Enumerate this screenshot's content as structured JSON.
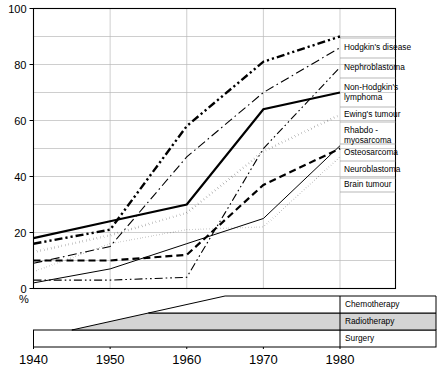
{
  "chart_data": {
    "type": "line",
    "title": "",
    "xlabel": "",
    "ylabel": "%",
    "ylim": [
      0,
      100
    ],
    "xlim": [
      1940,
      1980
    ],
    "yticks": [
      0,
      20,
      40,
      60,
      80,
      100
    ],
    "ytick_labels": [
      "0",
      "20",
      "40",
      "60",
      "80",
      "100"
    ],
    "xticks": [
      1940,
      1950,
      1960,
      1970,
      1980
    ],
    "xtick_labels": [
      "1940",
      "1950",
      "1960",
      "1970",
      "1980"
    ],
    "grid": "horizontal gridlines every 10 units, vertical gridlines at each decade",
    "legend_position": "right, line-ends labelled",
    "x": [
      1940,
      1950,
      1960,
      1970,
      1980
    ],
    "series": [
      {
        "name": "Hodgkin's disease",
        "style": "thick-dash-dot-dot",
        "x": [
          1940,
          1950,
          1960,
          1970,
          1980
        ],
        "values": [
          16,
          21,
          58,
          81,
          90
        ]
      },
      {
        "name": "Nephroblastoma",
        "style": "thin-dash-dot",
        "x": [
          1940,
          1950,
          1960,
          1970,
          1980
        ],
        "values": [
          9,
          15,
          47,
          70,
          86
        ]
      },
      {
        "name": "Non-Hodgkin's lymphoma",
        "style": "thin-dash-dot-dot",
        "x": [
          1940,
          1950,
          1960,
          1965,
          1970,
          1980
        ],
        "values": [
          3,
          3,
          4,
          27,
          50,
          79
        ]
      },
      {
        "name": "Ewing's tumour",
        "style": "thick-solid",
        "x": [
          1940,
          1950,
          1960,
          1970,
          1980
        ],
        "values": [
          18,
          24,
          30,
          64,
          70
        ]
      },
      {
        "name": "Rhabdo-myosarcoma",
        "style": "thick-dotted",
        "x": [
          1940,
          1950,
          1960,
          1970,
          1980
        ],
        "values": [
          13,
          19,
          27,
          49,
          62
        ]
      },
      {
        "name": "Osteosarcoma",
        "style": "thin-solid",
        "x": [
          1940,
          1950,
          1960,
          1970,
          1980
        ],
        "values": [
          2,
          7,
          16,
          25,
          51
        ]
      },
      {
        "name": "Neuroblastoma",
        "style": "thick-dashed",
        "x": [
          1940,
          1950,
          1960,
          1970,
          1980
        ],
        "values": [
          10,
          10,
          12,
          37,
          50
        ]
      },
      {
        "name": "Brain tumour",
        "style": "fine-dotted",
        "x": [
          1940,
          1950,
          1960,
          1970,
          1980
        ],
        "values": [
          6,
          16,
          21,
          22,
          47
        ]
      }
    ],
    "therapy_bands": [
      {
        "name": "Chemotherapy",
        "label": "Chemotherapy",
        "fill": "#ffffff",
        "start_year": 1945,
        "full_year": 1965
      },
      {
        "name": "Radiotherapy",
        "label": "Radiotherapy",
        "fill": "#d4d4d4",
        "start_year": 1945,
        "full_year": 1955
      },
      {
        "name": "Surgery",
        "label": "Surgery",
        "fill": "#ffffff",
        "start_year": 1940,
        "full_year": 1940
      }
    ]
  },
  "axis": {
    "percent_symbol": "%"
  },
  "legend": {
    "items": [
      {
        "label": "Hodgkin's disease"
      },
      {
        "label": "Nephroblastoma"
      },
      {
        "label": "Non-Hodgkin's"
      },
      {
        "label": "lymphoma"
      },
      {
        "label": "Ewing's tumour"
      },
      {
        "label": "Rhabdo -"
      },
      {
        "label": "myosarcoma"
      },
      {
        "label": "Osteosarcoma"
      },
      {
        "label": "Neuroblastoma"
      },
      {
        "label": "Brain tumour"
      }
    ]
  },
  "bands": {
    "items": [
      {
        "label": "Chemotherapy"
      },
      {
        "label": "Radiotherapy"
      },
      {
        "label": "Surgery"
      }
    ]
  },
  "colors": {
    "ink": "#000000",
    "grid": "#b9b9b9",
    "band_fill": "#d4d4d4",
    "background": "#ffffff"
  }
}
